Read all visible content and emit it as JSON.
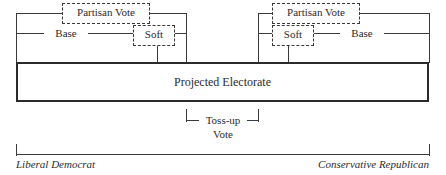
{
  "diagram": {
    "type": "bracket-spectrum-diagram",
    "colors": {
      "line": "#3a3a3a",
      "box_border": "#2b2b2b",
      "text": "#2b2b2b",
      "background": "#ffffff"
    },
    "top_brackets": {
      "left": {
        "partisan_vote_label": "Partisan Vote",
        "base_label": "Base",
        "soft_label": "Soft"
      },
      "right": {
        "partisan_vote_label": "Partisan Vote",
        "soft_label": "Soft",
        "base_label": "Base"
      }
    },
    "center_box": {
      "label": "Projected Electorate"
    },
    "bottom_bracket": {
      "label_line1": "Toss-up",
      "label_line2": "Vote"
    },
    "axis": {
      "left_pole_label": "Liberal Democrat",
      "right_pole_label": "Conservative Republican"
    }
  }
}
